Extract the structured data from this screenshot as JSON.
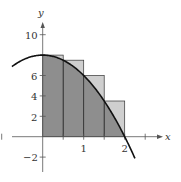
{
  "chart_data": {
    "type": "area",
    "title": "",
    "function": "f(x) = 8 - 2x^2",
    "xlabel": "x",
    "ylabel": "y",
    "xlim": [
      -1.0,
      2.7
    ],
    "ylim": [
      -3.0,
      11.5
    ],
    "x_ticks": [
      -1,
      0.5,
      1,
      1.5,
      2,
      2.5
    ],
    "x_tick_labels": {
      "1": "1",
      "2": "2"
    },
    "y_ticks": [
      -2,
      2,
      4,
      6,
      8,
      10
    ],
    "y_tick_labels": [
      "-2",
      "2",
      "4",
      "6",
      "10"
    ],
    "grid": false,
    "rectangles": {
      "description": "Upper sum rectangles, width 0.5",
      "x_left": [
        0,
        0.5,
        1.0,
        1.5
      ],
      "width": 0.5,
      "heights": [
        8,
        7.5,
        6,
        3.5
      ]
    },
    "curve_points": {
      "x": [
        -0.75,
        -0.5,
        -0.25,
        0,
        0.25,
        0.5,
        0.75,
        1.0,
        1.25,
        1.5,
        1.75,
        2.0,
        2.25
      ],
      "y": [
        6.875,
        7.5,
        7.875,
        8,
        7.875,
        7.5,
        6.875,
        6,
        4.875,
        3.5,
        1.875,
        0,
        -2.125
      ]
    },
    "colors": {
      "under_curve": "#8e8e8e",
      "above_curve": "#cfcfcf",
      "curve": "#111111",
      "axis": "#555555"
    }
  },
  "labels": {
    "x_axis": "x",
    "y_axis": "y",
    "y10": "10",
    "y6": "6",
    "y4": "4",
    "y2": "2",
    "yneg2": "−2",
    "x1": "1",
    "x2": "2"
  }
}
